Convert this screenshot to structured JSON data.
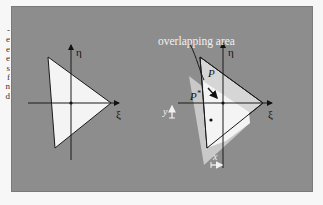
{
  "figure": {
    "left_margin_fragments": [
      "-",
      "e",
      "e",
      "e",
      "s",
      "f",
      "n",
      "d"
    ],
    "colors": {
      "panel_bg": "#8d8d8d",
      "triangle_light": "#f4f4f4",
      "triangle_mid": "#c9c9c9",
      "line": "#1a1a1a",
      "annotation_text": "#f2f2f2"
    },
    "left_diagram": {
      "axis_eta_label": "η",
      "axis_xi_label": "ξ"
    },
    "right_diagram": {
      "annotation": "overlapping area",
      "label_p": "P",
      "label_p_star": "P",
      "label_p_star_sup": "*",
      "axis_eta_label": "η",
      "axis_xi_label": "ξ",
      "axis_y_label": "y",
      "axis_x_label": "x"
    }
  }
}
